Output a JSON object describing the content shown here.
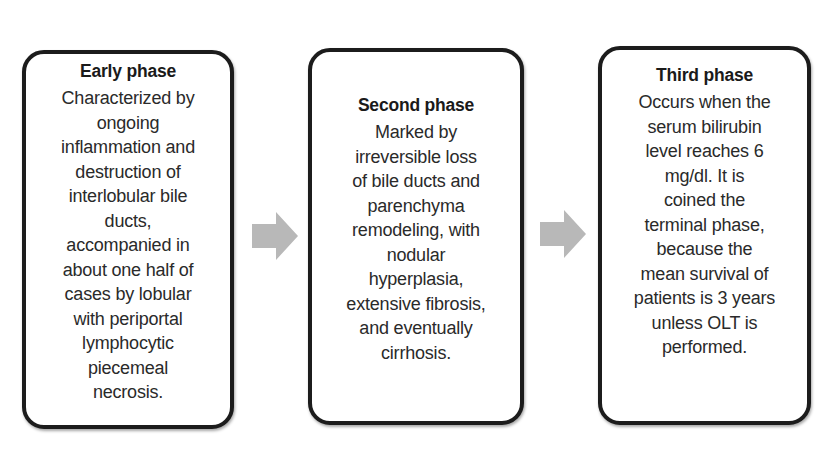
{
  "diagram": {
    "type": "flow",
    "direction": "left-to-right",
    "arrow_color": "#b8b8b8",
    "border_color": "#1c1c1c",
    "phases": [
      {
        "title": "Early phase",
        "body_lines": [
          "Characterized by",
          "ongoing",
          "inflammation and",
          "destruction of",
          "interlobular bile",
          "ducts,",
          "accompanied in",
          "about one half of",
          "cases by lobular",
          "with periportal",
          "lymphocytic",
          "piecemeal",
          "necrosis."
        ]
      },
      {
        "title": "Second phase",
        "body_lines": [
          "Marked by",
          "irreversible loss",
          "of bile ducts and",
          "parenchyma",
          "remodeling, with",
          "nodular",
          "hyperplasia,",
          "extensive fibrosis,",
          "and eventually",
          "cirrhosis."
        ]
      },
      {
        "title": "Third phase",
        "body_lines": [
          "Occurs when the",
          "serum bilirubin",
          "level reaches 6",
          "mg/dl. It is",
          "coined the",
          "terminal phase,",
          "because the",
          "mean survival of",
          "patients is 3 years",
          "unless OLT is",
          "performed."
        ]
      }
    ],
    "arrows": [
      {
        "from": "Early phase",
        "to": "Second phase",
        "icon": "right-arrow-icon"
      },
      {
        "from": "Second phase",
        "to": "Third phase",
        "icon": "right-arrow-icon"
      }
    ]
  }
}
